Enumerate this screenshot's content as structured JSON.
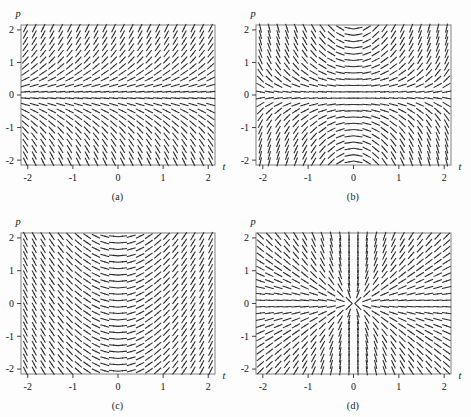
{
  "figure": {
    "background_color": "#fdfdfd",
    "frame_color": "#8c8c8c",
    "stroke_color": "#2b2b2b",
    "panel_count": 4
  },
  "axis": {
    "x_label": "t",
    "y_label": "p",
    "x_ticks": [
      "-2",
      "-1",
      "0",
      "1",
      "2"
    ],
    "y_ticks": [
      "2",
      "1",
      "0",
      "-1",
      "-2"
    ],
    "x_tick_values": [
      -2,
      -1,
      0,
      1,
      2
    ],
    "y_tick_values": [
      2,
      1,
      0,
      -1,
      -2
    ],
    "xlim": [
      -2.15,
      2.15
    ],
    "ylim": [
      -2.15,
      2.15
    ]
  },
  "panels": [
    {
      "caption": "(a)",
      "slope_rule": "p",
      "description": "slope depends only on p; horizontal along p = 0",
      "grid_nx": 22,
      "grid_ny": 22
    },
    {
      "caption": "(b)",
      "slope_rule": "t*p",
      "description": "slope proportional to t times p; horizontal along p = 0 and t = 0",
      "grid_nx": 22,
      "grid_ny": 22
    },
    {
      "caption": "(c)",
      "slope_rule": "t",
      "description": "slope depends only on t; horizontal along t = 0",
      "grid_nx": 22,
      "grid_ny": 22
    },
    {
      "caption": "(d)",
      "slope_rule": "p/t",
      "description": "slope equals p divided by t; vertical near t = 0 on the left, flattening to the right",
      "grid_nx": 22,
      "grid_ny": 22
    }
  ],
  "chart_data": {
    "type": "scatter",
    "title": "",
    "xlabel": "t",
    "ylabel": "p",
    "xlim": [
      -2.15,
      2.15
    ],
    "ylim": [
      -2.15,
      2.15
    ],
    "grid": false,
    "legend": "none",
    "subplots": [
      {
        "label": "(a)",
        "field": "dp/dt = p",
        "samples": [
          {
            "t": -2,
            "p": 2,
            "slope": 2
          },
          {
            "t": 0,
            "p": 2,
            "slope": 2
          },
          {
            "t": 2,
            "p": 2,
            "slope": 2
          },
          {
            "t": -2,
            "p": 1,
            "slope": 1
          },
          {
            "t": 0,
            "p": 1,
            "slope": 1
          },
          {
            "t": 2,
            "p": 1,
            "slope": 1
          },
          {
            "t": -2,
            "p": 0,
            "slope": 0
          },
          {
            "t": 0,
            "p": 0,
            "slope": 0
          },
          {
            "t": 2,
            "p": 0,
            "slope": 0
          },
          {
            "t": -2,
            "p": -1,
            "slope": -1
          },
          {
            "t": 0,
            "p": -1,
            "slope": -1
          },
          {
            "t": 2,
            "p": -1,
            "slope": -1
          },
          {
            "t": -2,
            "p": -2,
            "slope": -2
          },
          {
            "t": 0,
            "p": -2,
            "slope": -2
          },
          {
            "t": 2,
            "p": -2,
            "slope": -2
          }
        ]
      },
      {
        "label": "(b)",
        "field": "dp/dt = t p",
        "samples": [
          {
            "t": -2,
            "p": 2,
            "slope": -4
          },
          {
            "t": -1,
            "p": 2,
            "slope": -2
          },
          {
            "t": 0,
            "p": 2,
            "slope": 0
          },
          {
            "t": 1,
            "p": 2,
            "slope": 2
          },
          {
            "t": 2,
            "p": 2,
            "slope": 4
          },
          {
            "t": -2,
            "p": 0,
            "slope": 0
          },
          {
            "t": 0,
            "p": 0,
            "slope": 0
          },
          {
            "t": 2,
            "p": 0,
            "slope": 0
          },
          {
            "t": -2,
            "p": -2,
            "slope": 4
          },
          {
            "t": -1,
            "p": -2,
            "slope": 2
          },
          {
            "t": 0,
            "p": -2,
            "slope": 0
          },
          {
            "t": 1,
            "p": -2,
            "slope": -2
          },
          {
            "t": 2,
            "p": -2,
            "slope": -4
          }
        ]
      },
      {
        "label": "(c)",
        "field": "dp/dt = t",
        "samples": [
          {
            "t": -2,
            "p": 2,
            "slope": -2
          },
          {
            "t": -1,
            "p": 2,
            "slope": -1
          },
          {
            "t": 0,
            "p": 2,
            "slope": 0
          },
          {
            "t": 1,
            "p": 2,
            "slope": 1
          },
          {
            "t": 2,
            "p": 2,
            "slope": 2
          },
          {
            "t": -2,
            "p": 0,
            "slope": -2
          },
          {
            "t": 0,
            "p": 0,
            "slope": 0
          },
          {
            "t": 2,
            "p": 0,
            "slope": 2
          },
          {
            "t": -2,
            "p": -2,
            "slope": -2
          },
          {
            "t": 0,
            "p": -2,
            "slope": 0
          },
          {
            "t": 2,
            "p": -2,
            "slope": 2
          }
        ]
      },
      {
        "label": "(d)",
        "field": "dp/dt = p / t",
        "samples": [
          {
            "t": -2,
            "p": 2,
            "slope": -1
          },
          {
            "t": -1,
            "p": 2,
            "slope": -2
          },
          {
            "t": 1,
            "p": 2,
            "slope": 2
          },
          {
            "t": 2,
            "p": 2,
            "slope": 1
          },
          {
            "t": -2,
            "p": 0,
            "slope": 0
          },
          {
            "t": 2,
            "p": 0,
            "slope": 0
          },
          {
            "t": -2,
            "p": -2,
            "slope": 1
          },
          {
            "t": -1,
            "p": -2,
            "slope": 2
          },
          {
            "t": 1,
            "p": -2,
            "slope": -2
          },
          {
            "t": 2,
            "p": -2,
            "slope": -1
          }
        ]
      }
    ]
  }
}
